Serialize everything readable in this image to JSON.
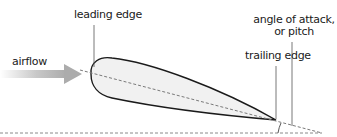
{
  "diagram": {
    "type": "airfoil-angle-of-attack",
    "labels": {
      "leading_edge": "leading edge",
      "airflow": "airflow",
      "trailing_edge": "trailing edge",
      "angle_of_attack_line1": "angle of attack,",
      "angle_of_attack_line2": "or pitch"
    },
    "colors": {
      "airfoil_fill": "#f1f1f1",
      "airfoil_stroke": "#1a1a1a",
      "chord_line": "#777777",
      "horizontal_reference": "#888888",
      "arrow": "#b0b0b0",
      "leader_lines": "#555555"
    }
  }
}
